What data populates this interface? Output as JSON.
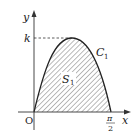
{
  "diagram": {
    "axes": {
      "x_label": "x",
      "y_label": "y",
      "origin_label": "O"
    },
    "y_tick_label": "k",
    "x_tick_label": {
      "numerator": "π",
      "denominator": "2"
    },
    "curve_label": {
      "main": "C",
      "sub": "1"
    },
    "region_label": {
      "main": "S",
      "sub": "1"
    },
    "colors": {
      "stroke": "#222222",
      "hatch": "#555555",
      "background": "#ffffff"
    }
  }
}
